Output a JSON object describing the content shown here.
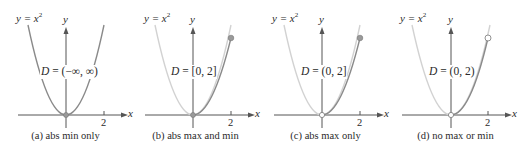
{
  "colors": {
    "axis": "#555555",
    "curve_included": "#8a8a8a",
    "curve_excluded": "#d2d2d2",
    "point_fill": "#9a9a9a",
    "open_point_fill": "#ffffff"
  },
  "panels": [
    {
      "equation_lhs": "y = x",
      "equation_exp": "2",
      "y_label": "y",
      "x_label": "x",
      "tick_label": "2",
      "domain_var": "D",
      "domain_text": " = (−∞, ∞)",
      "caption": "(a) abs min only"
    },
    {
      "equation_lhs": "y = x",
      "equation_exp": "2",
      "y_label": "y",
      "x_label": "x",
      "tick_label": "2",
      "domain_var": "D",
      "domain_text": " = [0, 2]",
      "caption": "(b) abs max and min"
    },
    {
      "equation_lhs": "y = x",
      "equation_exp": "2",
      "y_label": "y",
      "x_label": "x",
      "tick_label": "2",
      "domain_var": "D",
      "domain_text": " = (0, 2]",
      "caption": "(c) abs max only"
    },
    {
      "equation_lhs": "y = x",
      "equation_exp": "2",
      "y_label": "y",
      "x_label": "x",
      "tick_label": "2",
      "domain_var": "D",
      "domain_text": " = (0, 2)",
      "caption": "(d) no max or min"
    }
  ]
}
